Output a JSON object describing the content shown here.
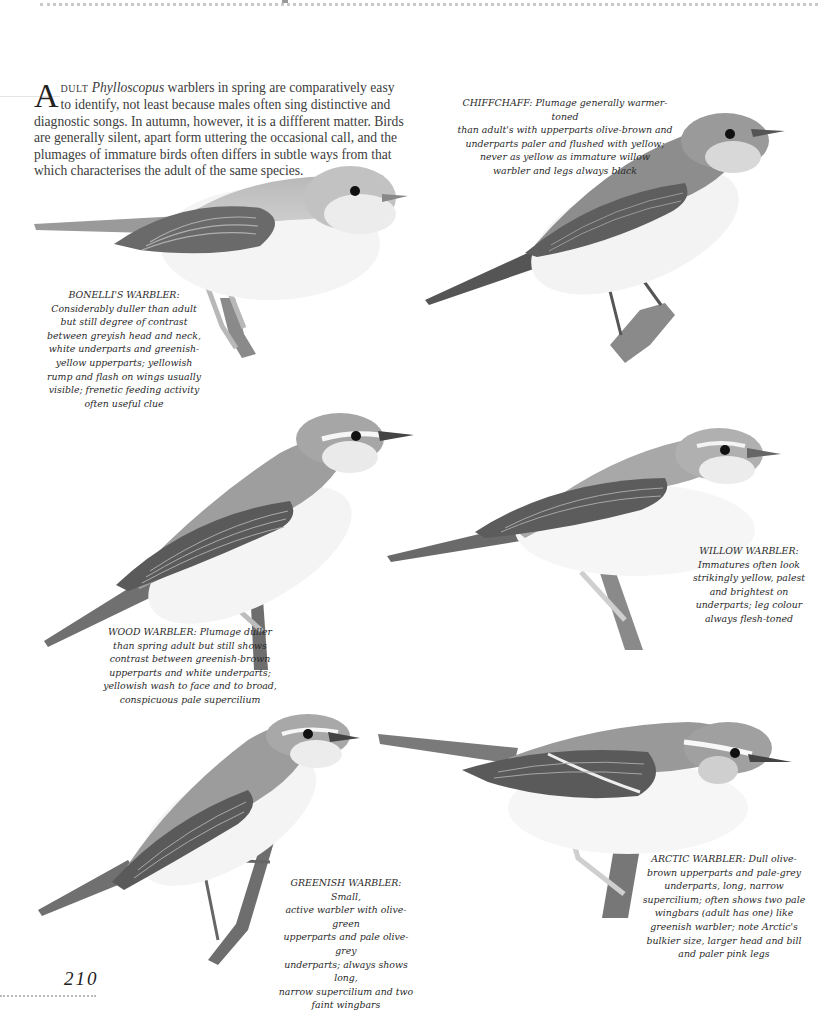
{
  "page": {
    "number": "210",
    "intro": {
      "dropcap": "A",
      "smallcaps": "DULT",
      "italic_genus": "Phylloscopus",
      "text": " warblers in spring are comparatively easy to identify, not least because males often sing distinctive and diagnostic songs. In autumn, however, it is a diffferent matter. Birds are generally silent, apart form uttering the occasional call, and the plumages of immature birds often differs in subtle ways from that which characterises the adult of the same species."
    }
  },
  "colors": {
    "ink": "#2a2a2a",
    "bird_dark": "#4a4a4a",
    "bird_mid": "#8c8c8c",
    "bird_light": "#c4c4c4",
    "bird_belly": "#f2f2f2"
  },
  "captions": [
    {
      "id": "bonelli",
      "species": "BONELLI'S WARBLER:",
      "lines": [
        "Considerably duller than adult",
        "but still degree of contrast",
        "between greyish head and neck,",
        "white underparts and greenish-",
        "yellow upperparts; yellowish",
        "rump and flash on wings usually",
        "visible; frenetic feeding activity",
        "often useful clue"
      ]
    },
    {
      "id": "chiffchaff",
      "species": "CHIFFCHAFF:",
      "lines": [
        "Plumage generally warmer-toned",
        "than adult's with upperparts olive-brown and",
        "underparts paler and flushed with yellow;",
        "never as yellow as immature willow",
        "warbler and legs always black"
      ]
    },
    {
      "id": "wood",
      "species": "WOOD WARBLER:",
      "lines": [
        "Plumage duller",
        "than spring adult but still shows",
        "contrast between greenish-brown",
        "upperparts and white underparts;",
        "yellowish wash to face and to broad,",
        "conspicuous pale supercilium"
      ]
    },
    {
      "id": "willow",
      "species": "WILLOW WARBLER:",
      "lines": [
        "Immatures often look",
        "strikingly yellow, palest",
        "and brightest on",
        "underparts; leg colour",
        "always flesh-toned"
      ]
    },
    {
      "id": "greenish",
      "species": "GREENISH WARBLER:",
      "lines": [
        "Small,",
        "active warbler with olive-green",
        "upperparts and pale olive-grey",
        "underparts; always shows long,",
        "narrow supercilium and two",
        "faint wingbars"
      ]
    },
    {
      "id": "arctic",
      "species": "ARCTIC WARBLER:",
      "lines": [
        "Dull olive-",
        "brown upperparts and pale-grey",
        "underparts, long, narrow",
        "supercilium; often shows two pale",
        "wingbars (adult has one) like",
        "greenish warbler; note Arctic's",
        "bulkier size, larger head and bill",
        "and paler pink legs"
      ]
    }
  ],
  "illustrations": [
    {
      "name": "bonelli-warbler-illustration"
    },
    {
      "name": "chiffchaff-illustration"
    },
    {
      "name": "wood-warbler-illustration"
    },
    {
      "name": "willow-warbler-illustration"
    },
    {
      "name": "greenish-warbler-illustration"
    },
    {
      "name": "arctic-warbler-illustration"
    }
  ]
}
